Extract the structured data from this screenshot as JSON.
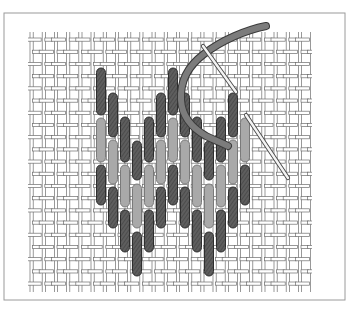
{
  "figure": {
    "description": "Black-and-white line illustration of Florentine (bargello) stitch worked on canvas mesh, with a threaded needle",
    "colors": {
      "background": "#ffffff",
      "frame": "#9a9a9a",
      "mesh": "#6e6e6e",
      "mesh_fill": "#ffffff",
      "dark_stitch": "#5e5e5e",
      "dark_stitch_edge": "#2e2e2e",
      "light_stitch": "#a9a9a9",
      "light_stitch_edge": "#7a7a7a",
      "thread": "#7c7c7c",
      "thread_edge": "#3a3a3a",
      "needle": "#f4f4f4",
      "needle_edge": "#4a4a4a"
    },
    "frame": {
      "x": 4,
      "y": 13,
      "w": 341,
      "h": 287
    },
    "canvas": {
      "x": 28,
      "y": 32,
      "w": 284,
      "h": 260,
      "pitch": 12.2
    },
    "stitch_width": 9,
    "columns_x": [
      101,
      113,
      125,
      137,
      149,
      161,
      173,
      185,
      197,
      209,
      221,
      233,
      245
    ],
    "dark_stitches": [
      {
        "col": 0,
        "y1": 68,
        "y2": 115
      },
      {
        "col": 1,
        "y1": 93,
        "y2": 137
      },
      {
        "col": 2,
        "y1": 117,
        "y2": 162
      },
      {
        "col": 3,
        "y1": 141,
        "y2": 180
      },
      {
        "col": 4,
        "y1": 117,
        "y2": 162
      },
      {
        "col": 5,
        "y1": 93,
        "y2": 137
      },
      {
        "col": 6,
        "y1": 68,
        "y2": 115
      },
      {
        "col": 7,
        "y1": 93,
        "y2": 137
      },
      {
        "col": 8,
        "y1": 117,
        "y2": 162
      },
      {
        "col": 9,
        "y1": 141,
        "y2": 180
      },
      {
        "col": 10,
        "y1": 117,
        "y2": 162
      },
      {
        "col": 11,
        "y1": 93,
        "y2": 137
      },
      {
        "col": 0,
        "y1": 165,
        "y2": 205
      },
      {
        "col": 1,
        "y1": 187,
        "y2": 228
      },
      {
        "col": 2,
        "y1": 210,
        "y2": 252
      },
      {
        "col": 3,
        "y1": 232,
        "y2": 276
      },
      {
        "col": 4,
        "y1": 210,
        "y2": 252
      },
      {
        "col": 5,
        "y1": 187,
        "y2": 228
      },
      {
        "col": 6,
        "y1": 165,
        "y2": 205
      },
      {
        "col": 7,
        "y1": 187,
        "y2": 228
      },
      {
        "col": 8,
        "y1": 210,
        "y2": 252
      },
      {
        "col": 9,
        "y1": 232,
        "y2": 276
      },
      {
        "col": 10,
        "y1": 210,
        "y2": 252
      },
      {
        "col": 11,
        "y1": 187,
        "y2": 228
      },
      {
        "col": 12,
        "y1": 165,
        "y2": 205
      }
    ],
    "light_stitches": [
      {
        "col": 0,
        "y1": 118,
        "y2": 162
      },
      {
        "col": 1,
        "y1": 140,
        "y2": 184
      },
      {
        "col": 2,
        "y1": 165,
        "y2": 207
      },
      {
        "col": 3,
        "y1": 184,
        "y2": 228
      },
      {
        "col": 4,
        "y1": 165,
        "y2": 207
      },
      {
        "col": 5,
        "y1": 140,
        "y2": 184
      },
      {
        "col": 6,
        "y1": 118,
        "y2": 162
      },
      {
        "col": 7,
        "y1": 140,
        "y2": 184
      },
      {
        "col": 8,
        "y1": 165,
        "y2": 207
      },
      {
        "col": 9,
        "y1": 184,
        "y2": 228
      },
      {
        "col": 10,
        "y1": 165,
        "y2": 207
      },
      {
        "col": 11,
        "y1": 140,
        "y2": 184
      },
      {
        "col": 12,
        "y1": 118,
        "y2": 162
      }
    ],
    "thread_path": "M 266 26 C 246 30, 222 40, 204 54 C 188 66, 180 82, 181 100 C 182 116, 192 128, 206 136 C 214 140, 220 142, 228 146",
    "needles": [
      {
        "x1": 203,
        "y1": 46,
        "x2": 236,
        "y2": 92,
        "label": "needle-upper"
      },
      {
        "x1": 246,
        "y1": 115,
        "x2": 288,
        "y2": 178,
        "label": "needle-lower"
      }
    ]
  }
}
